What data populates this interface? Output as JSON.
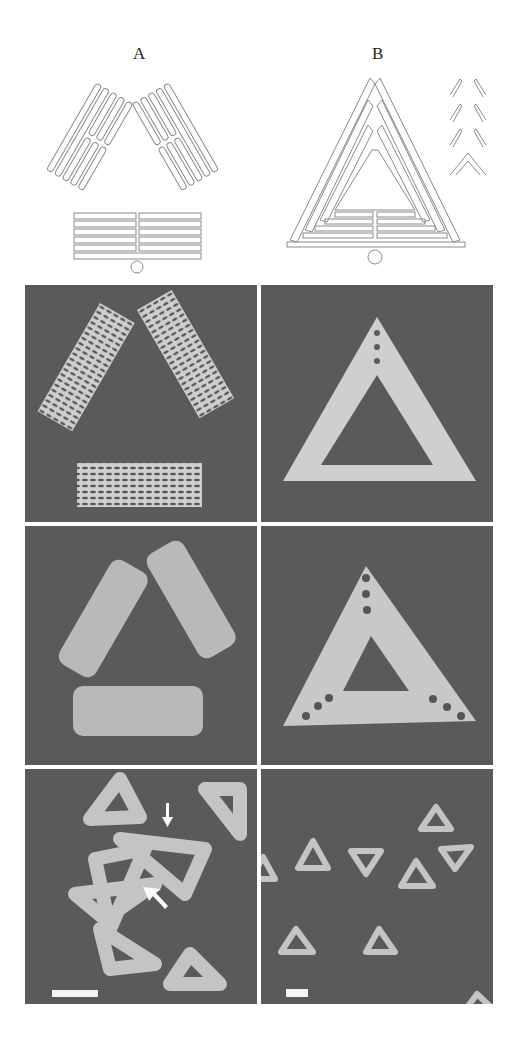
{
  "figure": {
    "columns": [
      {
        "label": "A",
        "description": "Triangle assembled from three rectangular trapezoid-like domains with hinged vertices"
      },
      {
        "label": "B",
        "description": "Triangle assembled from three trapezoid domains with interlocking edges (inset shows seam detail)"
      }
    ],
    "rows": [
      {
        "name": "design-schematic",
        "type": "line drawing"
      },
      {
        "name": "helix-model",
        "type": "rendered model"
      },
      {
        "name": "afm-zoom",
        "type": "AFM image, single structure"
      },
      {
        "name": "afm-field",
        "type": "AFM image, field of structures"
      }
    ],
    "scale_bars": [
      {
        "column": "A",
        "length_px": 46
      },
      {
        "column": "B",
        "length_px": 22
      }
    ],
    "annotations": [
      {
        "column": "A",
        "row": "afm-field",
        "type": "arrow",
        "direction": "down"
      },
      {
        "column": "A",
        "row": "afm-field",
        "type": "arrow",
        "direction": "up-left"
      }
    ],
    "colors": {
      "background": "#ffffff",
      "panel_bg": "#5a5a5a",
      "structure": "#d8d8d8",
      "line": "#8a8a8a"
    }
  }
}
